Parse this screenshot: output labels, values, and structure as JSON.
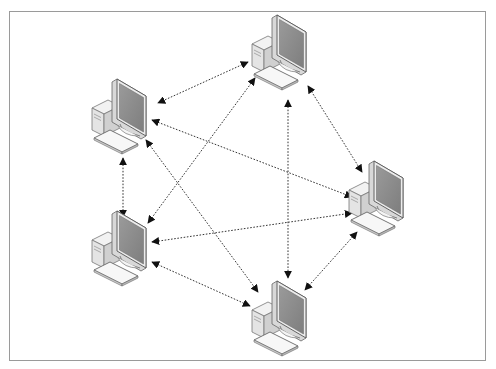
{
  "diagram": {
    "type": "full-mesh",
    "border_color": "#9a9a9a",
    "line_color": "#333333",
    "screen_color": "#8a8a8a",
    "nodes": [
      {
        "id": "top",
        "label": "Computer 1",
        "x": 250,
        "y": 14
      },
      {
        "id": "left-upper",
        "label": "Computer 2",
        "x": 90,
        "y": 78
      },
      {
        "id": "right",
        "label": "Computer 3",
        "x": 347,
        "y": 160
      },
      {
        "id": "left-lower",
        "label": "Computer 4",
        "x": 90,
        "y": 210
      },
      {
        "id": "bottom",
        "label": "Computer 5",
        "x": 250,
        "y": 280
      }
    ],
    "connections": [
      {
        "from": "top",
        "to": "left-upper",
        "x1": 248,
        "y1": 62,
        "x2": 158,
        "y2": 103
      },
      {
        "from": "top",
        "to": "left-lower",
        "x1": 255,
        "y1": 78,
        "x2": 148,
        "y2": 223
      },
      {
        "from": "top",
        "to": "bottom",
        "x1": 288,
        "y1": 100,
        "x2": 288,
        "y2": 278
      },
      {
        "from": "top",
        "to": "right",
        "x1": 308,
        "y1": 86,
        "x2": 362,
        "y2": 172
      },
      {
        "from": "left-upper",
        "to": "right",
        "x1": 152,
        "y1": 120,
        "x2": 352,
        "y2": 197
      },
      {
        "from": "left-upper",
        "to": "bottom",
        "x1": 146,
        "y1": 140,
        "x2": 258,
        "y2": 292
      },
      {
        "from": "left-upper",
        "to": "left-lower",
        "x1": 123,
        "y1": 158,
        "x2": 123,
        "y2": 217
      },
      {
        "from": "left-lower",
        "to": "right",
        "x1": 152,
        "y1": 242,
        "x2": 352,
        "y2": 213
      },
      {
        "from": "left-lower",
        "to": "bottom",
        "x1": 152,
        "y1": 262,
        "x2": 250,
        "y2": 306
      },
      {
        "from": "right",
        "to": "bottom",
        "x1": 357,
        "y1": 232,
        "x2": 305,
        "y2": 290
      }
    ]
  }
}
